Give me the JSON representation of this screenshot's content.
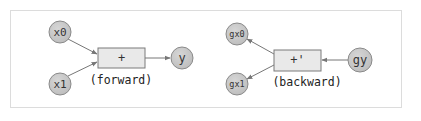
{
  "diagram": {
    "forward": {
      "inputs": [
        "x0",
        "x1"
      ],
      "op_label": "+",
      "output": "y",
      "caption": "(forward)"
    },
    "backward": {
      "outputs": [
        "gx0",
        "gx1"
      ],
      "op_label": "+'",
      "input": "gy",
      "caption": "(backward)"
    },
    "colors": {
      "node_fill": "#c8c8c8",
      "node_stroke": "#8a8a8a",
      "box_fill": "#e9e9e9",
      "box_stroke": "#7a7a7a",
      "edge": "#777777",
      "frame": "#dcdcdc"
    }
  }
}
